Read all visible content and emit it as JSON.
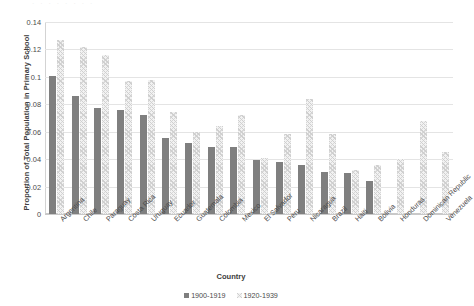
{
  "chart_data": {
    "type": "bar",
    "title": "",
    "xlabel": "Country",
    "ylabel": "Proportion of Total Population in Primary School",
    "ylim": [
      0,
      0.14
    ],
    "yticks": [
      "0",
      "0.02",
      "0.04",
      "0.06",
      "0.08",
      "0.1",
      "0.12",
      "0.14"
    ],
    "ytick_values": [
      0,
      0.02,
      0.04,
      0.06,
      0.08,
      0.1,
      0.12,
      0.14
    ],
    "grid": true,
    "legend_position": "bottom",
    "categories": [
      "Argentina",
      "Chile",
      "Paraguay",
      "Costa Rica",
      "Uruguay",
      "Ecuador",
      "Guatemala",
      "Colombia",
      "Mexico",
      "El Salvador",
      "Peru",
      "Nicaragua",
      "Brazil",
      "Haiti",
      "Bolivia",
      "Honduras",
      "Dominican Republic",
      "Venezuela"
    ],
    "series": [
      {
        "name": "1900-1919",
        "color": "#7f7f7f",
        "values": [
          0.101,
          0.086,
          0.077,
          0.0755,
          0.072,
          0.0555,
          0.0515,
          0.049,
          0.049,
          0.0395,
          0.038,
          0.036,
          0.031,
          0.03,
          0.024,
          null,
          null,
          null
        ]
      },
      {
        "name": "1920-1939",
        "color": "#f2f2f2",
        "values": [
          0.127,
          0.122,
          0.116,
          0.097,
          0.098,
          0.0745,
          0.0595,
          0.064,
          0.0725,
          0.0405,
          0.058,
          0.084,
          0.0585,
          0.032,
          0.036,
          0.04,
          0.068,
          0.045
        ]
      }
    ]
  },
  "artifact": {
    "top_sliver_text": "· · · · · · · ·"
  }
}
